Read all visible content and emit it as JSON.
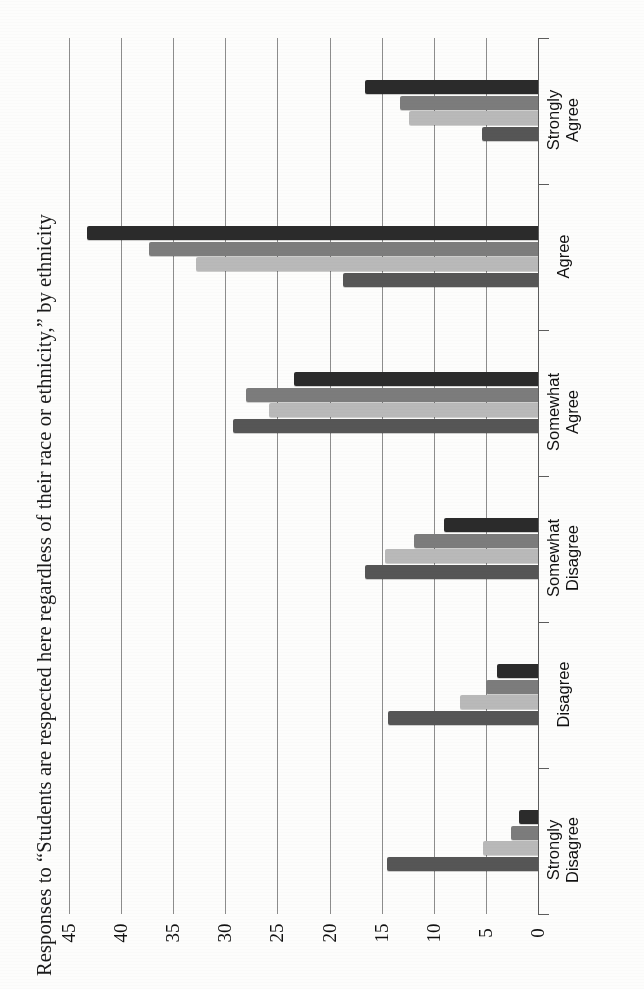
{
  "title": "Responses to “Students are respected here regardless of their race or ethnicity,” by ethnicity",
  "chart_data": {
    "type": "bar",
    "orientation": "horizontal",
    "title": "Responses to “Students are respected here regardless of their race or ethnicity,” by ethnicity",
    "xlabel": "",
    "ylabel": "",
    "categories": [
      "Strongly\nAgree",
      "Agree",
      "Somewhat\nAgree",
      "Somewhat\nDisagree",
      "Disagree",
      "Strongly\nDisagree"
    ],
    "series": [
      {
        "name": "Series 1",
        "color": "#2b2b2b",
        "values": [
          16.6,
          43.3,
          23.4,
          9.0,
          3.9,
          1.8
        ]
      },
      {
        "name": "Series 2",
        "color": "#7c7c7c",
        "values": [
          13.2,
          37.3,
          28.0,
          11.9,
          5.0,
          2.6
        ]
      },
      {
        "name": "Series 3",
        "color": "#b9b9b9",
        "values": [
          12.4,
          32.8,
          25.8,
          14.7,
          7.5,
          5.3
        ]
      },
      {
        "name": "Series 4",
        "color": "#565656",
        "values": [
          5.4,
          18.7,
          29.3,
          16.6,
          14.4,
          14.5
        ]
      }
    ],
    "value_ticks": [
      45,
      40,
      35,
      30,
      25,
      20,
      15,
      10,
      5,
      0
    ],
    "axis_min": 0,
    "axis_max": 45,
    "grid": true,
    "legend": "none",
    "axis_direction": "value axis increases right-to-left (page rotated 90°)"
  }
}
